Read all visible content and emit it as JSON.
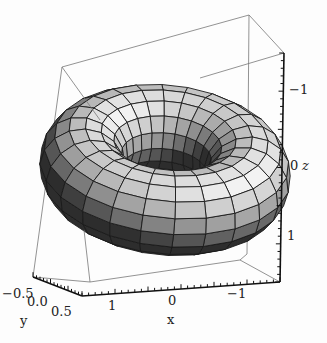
{
  "chart_data": {
    "type": "surface3d",
    "title": "",
    "surface": "torus",
    "torus": {
      "major_radius": 1.0,
      "minor_radius": 0.5,
      "u_segments": 24,
      "v_segments": 16
    },
    "axes": {
      "x": {
        "label": "x",
        "ticks": [
          "1",
          "0",
          "-1"
        ],
        "range": [
          1.5,
          -1.5
        ]
      },
      "y": {
        "label": "y",
        "ticks": [
          "-0.5",
          "0.0",
          "0.5"
        ],
        "range": [
          -0.5,
          0.5
        ]
      },
      "z": {
        "label": "z",
        "ticks": [
          "-1",
          "0",
          "1"
        ],
        "range": [
          -1.5,
          1.5
        ]
      }
    },
    "box": true,
    "colors": {
      "surface_light": "#f4f4f4",
      "surface_dark": "#3a3a3a",
      "mesh": "#1a1a1a",
      "box": "#777777",
      "axis": "#111111"
    }
  },
  "labels": {
    "y_ticks": [
      {
        "text": "−0.5",
        "x": 2,
        "y": 298
      },
      {
        "text": "0.0",
        "x": 27,
        "y": 306
      },
      {
        "text": "0.5",
        "x": 51,
        "y": 316
      }
    ],
    "x_ticks": [
      {
        "text": "1",
        "x": 108,
        "y": 310
      },
      {
        "text": "0",
        "x": 168,
        "y": 305
      },
      {
        "text": "−1",
        "x": 227,
        "y": 298
      }
    ],
    "z_ticks": [
      {
        "text": "−1",
        "x": 289,
        "y": 94
      },
      {
        "text": "0",
        "x": 290,
        "y": 170
      },
      {
        "text": "1",
        "x": 287,
        "y": 240
      }
    ],
    "x_axis_label": "x",
    "y_axis_label": "y",
    "z_axis_label": "z"
  }
}
